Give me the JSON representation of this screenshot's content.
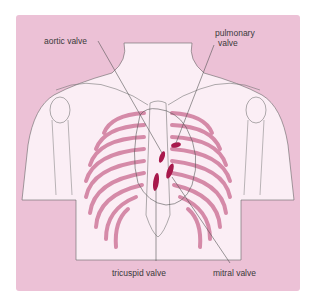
{
  "figure": {
    "background_color": "#ecc1d6",
    "body_color": "#fbeef5",
    "rib_color": "#d58aa8",
    "valve_color": "#a8194c",
    "line_color": "#555555"
  },
  "labels": {
    "aortic": "aortic valve",
    "pulmonary_line1": "pulmonary",
    "pulmonary_line2": "valve",
    "tricuspid": "tricuspid valve",
    "mitral": "mitral valve"
  }
}
